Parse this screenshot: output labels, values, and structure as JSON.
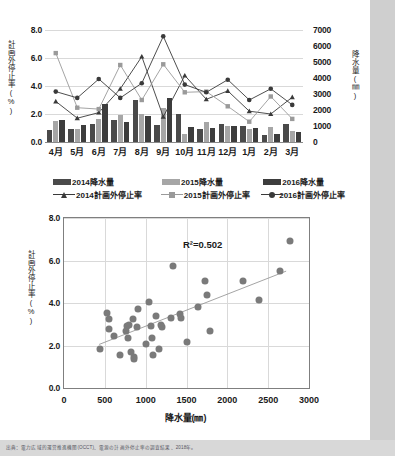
{
  "document": {
    "source_note": "出典：電力広域的運営推進機関(OCCT)、電源の計画外停止率の調査結果、2018年。"
  },
  "chart_data": [
    {
      "id": "monthly-bar-line",
      "type": "bar",
      "title": "",
      "xlabel": "",
      "ylabel": "計画外停止率(%)",
      "y2label": "降水量(㎜)",
      "categories": [
        "4月",
        "5月",
        "6月",
        "7月",
        "8月",
        "9月",
        "10月",
        "11月",
        "12月",
        "1月",
        "2月",
        "3月"
      ],
      "ylim": [
        0.0,
        8.0
      ],
      "yticks": [
        "0.0",
        "2.0",
        "4.0",
        "6.0",
        "8.0"
      ],
      "y2lim": [
        0,
        7000
      ],
      "y2ticks": [
        "0",
        "1000",
        "2000",
        "3000",
        "4000",
        "5000",
        "6000",
        "7000"
      ],
      "grid": true,
      "legend_position": "bottom",
      "bar_series": [
        {
          "name": "2014降水量",
          "color": "#4a4a4a",
          "axis": "right",
          "values": [
            750,
            830,
            1130,
            1400,
            2600,
            1080,
            1750,
            830,
            1110,
            980,
            430,
            1130
          ]
        },
        {
          "name": "2015降水量",
          "color": "#a6a6a6",
          "axis": "right",
          "values": [
            1330,
            790,
            1450,
            1680,
            1740,
            2130,
            530,
            1260,
            1030,
            790,
            930,
            680
          ]
        },
        {
          "name": "2016降水量",
          "color": "#3d3d3d",
          "axis": "right",
          "values": [
            1400,
            1080,
            2350,
            1230,
            1620,
            2720,
            960,
            860,
            1030,
            890,
            520,
            600
          ]
        }
      ],
      "line_series": [
        {
          "name": "2014計画外停止率",
          "color": "#3a3a3a",
          "marker": "triangle",
          "axis": "left",
          "values": [
            2.9,
            1.7,
            2.1,
            3.8,
            6.1,
            1.8,
            4.75,
            3.05,
            3.65,
            2.2,
            2.0,
            3.2
          ]
        },
        {
          "name": "2015計画外停止率",
          "color": "#9a9a9a",
          "marker": "square",
          "axis": "left",
          "values": [
            6.35,
            2.45,
            2.35,
            5.5,
            3.0,
            5.55,
            3.55,
            3.6,
            2.55,
            1.45,
            3.25,
            1.65
          ]
        },
        {
          "name": "2016計画外停止率",
          "color": "#3a3a3a",
          "marker": "circle",
          "axis": "left",
          "values": [
            3.6,
            3.15,
            4.5,
            3.15,
            4.2,
            7.55,
            4.1,
            3.55,
            4.45,
            3.0,
            3.8,
            2.65
          ]
        }
      ]
    },
    {
      "id": "precip-vs-outage-scatter",
      "type": "scatter",
      "title": "",
      "xlabel": "降水量(㎜)",
      "ylabel": "計画外停止率(%)",
      "xlim": [
        0,
        3000
      ],
      "ylim": [
        0.0,
        8.0
      ],
      "xticks": [
        "0",
        "500",
        "1000",
        "1500",
        "2000",
        "2500",
        "3000"
      ],
      "yticks": [
        "0.0",
        "2.0",
        "4.0",
        "6.0",
        "8.0"
      ],
      "grid": true,
      "annotation": "R²=0.502",
      "r_squared": 0.502,
      "marker_color": "#7a7a7a",
      "trendline": {
        "x0": 430,
        "y0": 2.05,
        "x1": 2720,
        "y1": 5.5,
        "color": "#9a9a9a"
      },
      "points": [
        {
          "x": 440,
          "y": 1.85
        },
        {
          "x": 530,
          "y": 3.55
        },
        {
          "x": 545,
          "y": 3.25
        },
        {
          "x": 545,
          "y": 2.8
        },
        {
          "x": 610,
          "y": 2.45
        },
        {
          "x": 680,
          "y": 1.55
        },
        {
          "x": 760,
          "y": 2.7
        },
        {
          "x": 775,
          "y": 2.9
        },
        {
          "x": 780,
          "y": 2.35
        },
        {
          "x": 800,
          "y": 2.95
        },
        {
          "x": 820,
          "y": 1.7
        },
        {
          "x": 850,
          "y": 3.25
        },
        {
          "x": 855,
          "y": 1.45
        },
        {
          "x": 855,
          "y": 1.35
        },
        {
          "x": 890,
          "y": 2.85
        },
        {
          "x": 900,
          "y": 3.7
        },
        {
          "x": 1000,
          "y": 2.05
        },
        {
          "x": 1040,
          "y": 4.05
        },
        {
          "x": 1060,
          "y": 2.9
        },
        {
          "x": 1080,
          "y": 2.35
        },
        {
          "x": 1090,
          "y": 1.55
        },
        {
          "x": 1130,
          "y": 3.4
        },
        {
          "x": 1160,
          "y": 1.85
        },
        {
          "x": 1190,
          "y": 2.95
        },
        {
          "x": 1200,
          "y": 2.85
        },
        {
          "x": 1310,
          "y": 3.3
        },
        {
          "x": 1330,
          "y": 5.75
        },
        {
          "x": 1420,
          "y": 3.5
        },
        {
          "x": 1430,
          "y": 3.3
        },
        {
          "x": 1510,
          "y": 2.15
        },
        {
          "x": 1640,
          "y": 3.8
        },
        {
          "x": 1730,
          "y": 5.05
        },
        {
          "x": 1750,
          "y": 4.4
        },
        {
          "x": 1790,
          "y": 2.7
        },
        {
          "x": 2190,
          "y": 5.05
        },
        {
          "x": 2390,
          "y": 4.15
        },
        {
          "x": 2650,
          "y": 5.5
        },
        {
          "x": 2770,
          "y": 6.9
        }
      ]
    }
  ]
}
